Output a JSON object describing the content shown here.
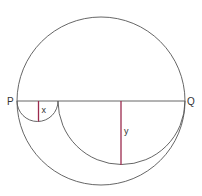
{
  "diagram": {
    "labels": {
      "p": "P",
      "q": "Q",
      "x": "x",
      "y": "y"
    },
    "colors": {
      "stroke": "#555555",
      "accent": "#9b2a4e",
      "text": "#333333"
    }
  }
}
